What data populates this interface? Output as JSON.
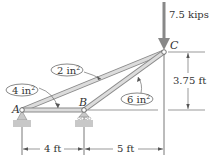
{
  "diagram": {
    "type": "truss",
    "nodes": {
      "A": {
        "label": "A",
        "support": "pin"
      },
      "B": {
        "label": "B",
        "support": "roller"
      },
      "C": {
        "label": "C",
        "support": "none"
      }
    },
    "members": [
      {
        "id": "AB",
        "area_label": "4 in²"
      },
      {
        "id": "AC",
        "area_label": "2 in²"
      },
      {
        "id": "BC",
        "area_label": "6 in²"
      }
    ],
    "labels": {
      "area_4": "4 in",
      "area_2": "2 in",
      "area_6": "6 in",
      "sup": "2"
    },
    "load": {
      "label": "7.5 kips",
      "node": "C",
      "direction": "down"
    },
    "dimensions": {
      "ab": "4 ft",
      "bc": "5 ft",
      "height": "3.75 ft"
    },
    "colors": {
      "member_fill": "#d9d9d9",
      "member_stroke": "#8a8a8a",
      "load_arrow": "#888888",
      "support_fill": "#c8c8c8",
      "line": "#555555"
    }
  }
}
